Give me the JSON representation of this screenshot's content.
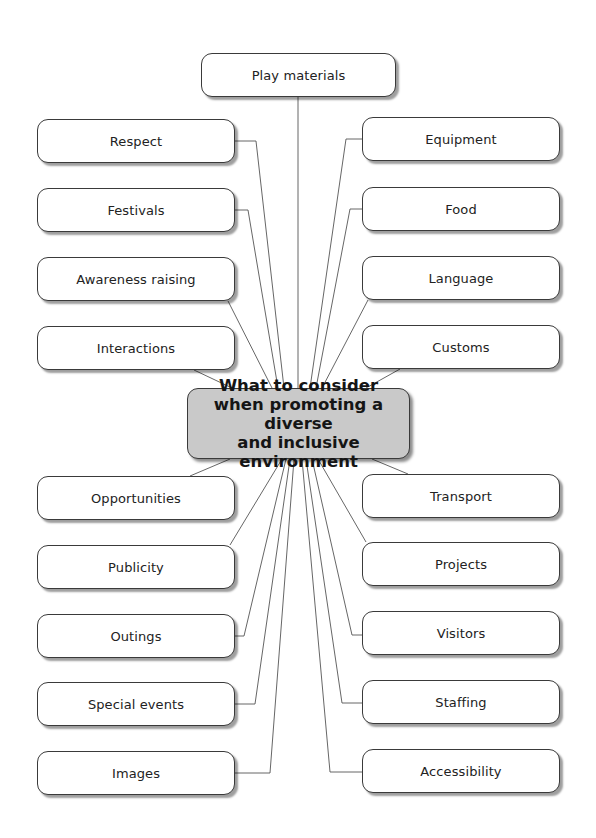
{
  "diagram": {
    "center": {
      "lines": [
        "What to consider",
        "when promoting a diverse",
        "and inclusive environment"
      ],
      "fill": "#c9c9c9",
      "box": {
        "x": 187,
        "y": 388,
        "w": 223,
        "h": 71
      }
    },
    "top": {
      "label": "Play materials",
      "box": {
        "x": 201,
        "y": 53,
        "w": 195,
        "h": 44
      }
    },
    "left": [
      {
        "label": "Respect",
        "y": 119
      },
      {
        "label": "Festivals",
        "y": 188
      },
      {
        "label": "Awareness raising",
        "y": 257
      },
      {
        "label": "Interactions",
        "y": 326
      },
      {
        "label": "Opportunities",
        "y": 476
      },
      {
        "label": "Publicity",
        "y": 545
      },
      {
        "label": "Outings",
        "y": 614
      },
      {
        "label": "Special events",
        "y": 682
      },
      {
        "label": "Images",
        "y": 751
      }
    ],
    "right": [
      {
        "label": "Equipment",
        "y": 117
      },
      {
        "label": "Food",
        "y": 187
      },
      {
        "label": "Language",
        "y": 256
      },
      {
        "label": "Customs",
        "y": 325
      },
      {
        "label": "Transport",
        "y": 474
      },
      {
        "label": "Projects",
        "y": 542
      },
      {
        "label": "Visitors",
        "y": 611
      },
      {
        "label": "Staffing",
        "y": 680
      },
      {
        "label": "Accessibility",
        "y": 749
      }
    ],
    "layout": {
      "left_x": 37,
      "right_x": 362,
      "box_w": 198,
      "box_h": 44
    },
    "connectors": [
      {
        "from": "Play materials",
        "points": [
          [
            298,
            97
          ],
          [
            298,
            388
          ]
        ]
      },
      {
        "from": "Respect",
        "points": [
          [
            235,
            141
          ],
          [
            256,
            141
          ],
          [
            284,
            388
          ]
        ]
      },
      {
        "from": "Festivals",
        "points": [
          [
            235,
            210
          ],
          [
            248,
            210
          ],
          [
            278,
            388
          ]
        ]
      },
      {
        "from": "Awareness raising",
        "points": [
          [
            228,
            301
          ],
          [
            272,
            388
          ]
        ]
      },
      {
        "from": "Interactions",
        "points": [
          [
            194,
            370
          ],
          [
            232,
            388
          ]
        ]
      },
      {
        "from": "Equipment",
        "points": [
          [
            362,
            139
          ],
          [
            346,
            139
          ],
          [
            310,
            388
          ]
        ]
      },
      {
        "from": "Food",
        "points": [
          [
            362,
            209
          ],
          [
            350,
            209
          ],
          [
            316,
            388
          ]
        ]
      },
      {
        "from": "Language",
        "points": [
          [
            368,
            300
          ],
          [
            322,
            388
          ]
        ]
      },
      {
        "from": "Customs",
        "points": [
          [
            400,
            369
          ],
          [
            366,
            388
          ]
        ]
      },
      {
        "from": "Opportunities",
        "points": [
          [
            230,
            459
          ],
          [
            190,
            476
          ]
        ]
      },
      {
        "from": "Publicity",
        "points": [
          [
            230,
            545
          ],
          [
            282,
            459
          ]
        ]
      },
      {
        "from": "Outings",
        "points": [
          [
            235,
            636
          ],
          [
            244,
            636
          ],
          [
            286,
            459
          ]
        ]
      },
      {
        "from": "Special events",
        "points": [
          [
            235,
            704
          ],
          [
            255,
            704
          ],
          [
            290,
            459
          ]
        ]
      },
      {
        "from": "Images",
        "points": [
          [
            235,
            773
          ],
          [
            270,
            773
          ],
          [
            294,
            459
          ]
        ]
      },
      {
        "from": "Transport",
        "points": [
          [
            408,
            474
          ],
          [
            372,
            459
          ]
        ]
      },
      {
        "from": "Projects",
        "points": [
          [
            366,
            542
          ],
          [
            318,
            459
          ]
        ]
      },
      {
        "from": "Visitors",
        "points": [
          [
            362,
            635
          ],
          [
            352,
            635
          ],
          [
            312,
            459
          ]
        ]
      },
      {
        "from": "Staffing",
        "points": [
          [
            362,
            703
          ],
          [
            342,
            703
          ],
          [
            306,
            459
          ]
        ]
      },
      {
        "from": "Accessibility",
        "points": [
          [
            362,
            772
          ],
          [
            330,
            772
          ],
          [
            302,
            459
          ]
        ]
      }
    ],
    "line_color": "#555555"
  }
}
